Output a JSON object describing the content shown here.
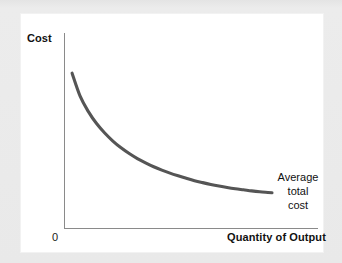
{
  "figure": {
    "background_color": "#e9e9e9",
    "card_color": "#ffffff",
    "axis_color": "#8a8a8a",
    "curve_color": "#555555"
  },
  "labels": {
    "y_axis": "Cost",
    "x_axis": "Quantity of Output",
    "origin": "0",
    "annotation_line1": "Average",
    "annotation_line2": "total",
    "annotation_line3": "cost"
  },
  "chart_data": {
    "type": "line",
    "title": "",
    "xlabel": "Quantity of Output",
    "ylabel": "Cost",
    "grid": false,
    "legend": "none",
    "annotations": [
      {
        "text": "Average total cost",
        "target": "end of curve",
        "x": 1.0,
        "y": 0.2
      }
    ],
    "axis_ticks": {
      "x": [
        "0"
      ],
      "y": []
    },
    "xlim": [
      0,
      1
    ],
    "ylim": [
      0,
      1
    ],
    "series": [
      {
        "name": "Average total cost",
        "x": [
          0.02,
          0.06,
          0.1,
          0.14,
          0.18,
          0.22,
          0.26,
          0.3,
          0.34,
          0.38,
          0.42,
          0.46,
          0.5,
          0.54,
          0.58,
          0.62,
          0.66,
          0.7,
          0.74,
          0.78,
          0.82,
          0.86,
          0.9,
          0.94,
          0.98,
          1.0
        ],
        "y": [
          0.87,
          0.74,
          0.655,
          0.588,
          0.535,
          0.49,
          0.452,
          0.42,
          0.392,
          0.368,
          0.346,
          0.327,
          0.31,
          0.295,
          0.281,
          0.268,
          0.257,
          0.247,
          0.238,
          0.23,
          0.223,
          0.217,
          0.211,
          0.206,
          0.202,
          0.2
        ]
      }
    ]
  }
}
